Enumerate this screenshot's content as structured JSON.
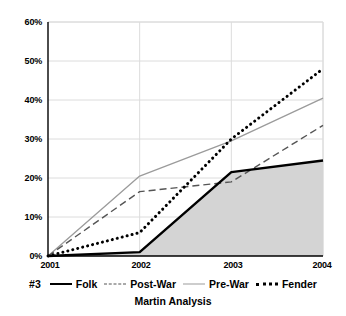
{
  "chart_data": {
    "type": "line",
    "title": "",
    "subtitle": "Martin Analysis",
    "series_key": "#3",
    "xlabel": "",
    "ylabel": "",
    "categories": [
      "2001",
      "2002",
      "2003",
      "2004"
    ],
    "x": [
      2001,
      2002,
      2003,
      2004
    ],
    "ylim": [
      0,
      60
    ],
    "yticks": [
      0,
      10,
      20,
      30,
      40,
      50,
      60
    ],
    "ytick_labels": [
      "0%",
      "10%",
      "20%",
      "30%",
      "40%",
      "50%",
      "60%"
    ],
    "grid": true,
    "legend_position": "bottom",
    "series": [
      {
        "name": "Folk",
        "style": "solid-thick-black",
        "color": "#000000",
        "filled": true,
        "fill_color": "#d4d4d4",
        "values": [
          0,
          1,
          21.5,
          24.5
        ]
      },
      {
        "name": "Post-War",
        "style": "dashed",
        "color": "#555555",
        "filled": false,
        "values": [
          0,
          16.5,
          19,
          33.5
        ]
      },
      {
        "name": "Pre-War",
        "style": "solid-thin-gray",
        "color": "#9b9b9b",
        "filled": false,
        "values": [
          0,
          20.5,
          29.5,
          40.5
        ]
      },
      {
        "name": "Fender",
        "style": "dotted-thick",
        "color": "#000000",
        "filled": false,
        "values": [
          0,
          6,
          30,
          48
        ]
      }
    ]
  },
  "legend": {
    "key": "#3",
    "items": [
      {
        "label": "Folk"
      },
      {
        "label": "Post-War"
      },
      {
        "label": "Pre-War"
      },
      {
        "label": "Fender"
      }
    ]
  },
  "axes": {
    "y_labels": [
      "60%",
      "50%",
      "40%",
      "30%",
      "20%",
      "10%",
      "0%"
    ],
    "x_labels": [
      "2001",
      "2002",
      "2003",
      "2004"
    ]
  },
  "colors": {
    "fill": "#d4d4d4",
    "grid": "#dcdcdc",
    "axis": "#000000",
    "folk": "#000000",
    "post_war": "#555555",
    "pre_war": "#9b9b9b",
    "fender": "#000000"
  },
  "footer": {
    "subtitle": "Martin Analysis"
  }
}
